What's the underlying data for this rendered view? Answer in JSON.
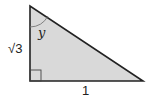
{
  "diagram": {
    "type": "right-triangle",
    "fill_color": "#d9d9d9",
    "stroke_color": "#222222",
    "vertices": {
      "top": [
        30,
        6
      ],
      "right_angle": [
        30,
        81
      ],
      "bottom_right": [
        143,
        81
      ]
    },
    "labels": {
      "vertical_side": "√3",
      "horizontal_side": "1",
      "angle": "y"
    },
    "angle_marks": {
      "right_angle_at": "bottom-left",
      "arc_at": "top"
    }
  }
}
